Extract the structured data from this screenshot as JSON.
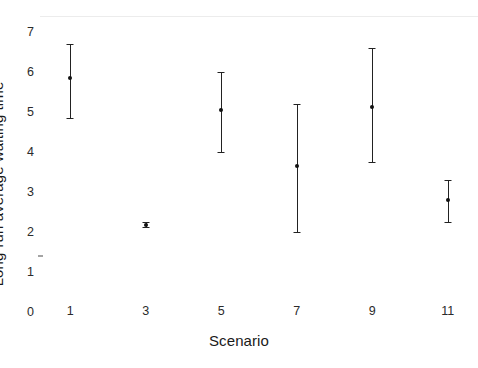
{
  "chart_data": {
    "type": "scatter",
    "title": "",
    "xlabel": "Scenario",
    "ylabel": "Long-run average waiting time",
    "xlim": [
      0.2,
      11.8
    ],
    "ylim": [
      0,
      7
    ],
    "grid": true,
    "legend": null,
    "xticks": [
      "1",
      "3",
      "5",
      "7",
      "9",
      "11"
    ],
    "xtick_values": [
      1,
      3,
      5,
      7,
      9,
      11
    ],
    "yticks": [
      "0",
      "1",
      "2",
      "3",
      "4",
      "5",
      "6",
      "7"
    ],
    "ytick_values": [
      0,
      1,
      2,
      3,
      4,
      5,
      6,
      7
    ],
    "categories": [
      1,
      3,
      5,
      7,
      9,
      11
    ],
    "values": [
      5.45,
      1.78,
      4.65,
      3.25,
      4.72,
      2.4
    ],
    "errors_low": [
      4.45,
      1.72,
      3.6,
      1.6,
      3.35,
      1.85
    ],
    "errors_high": [
      6.3,
      1.85,
      5.6,
      4.8,
      6.2,
      2.9
    ],
    "points": [
      {
        "x": 1,
        "y": 5.45,
        "low": 4.45,
        "high": 6.3
      },
      {
        "x": 3,
        "y": 1.78,
        "low": 1.72,
        "high": 1.85
      },
      {
        "x": 5,
        "y": 4.65,
        "low": 3.6,
        "high": 5.6
      },
      {
        "x": 7,
        "y": 3.25,
        "low": 1.6,
        "high": 4.8
      },
      {
        "x": 9,
        "y": 4.72,
        "low": 3.35,
        "high": 6.2
      },
      {
        "x": 11,
        "y": 2.4,
        "low": 1.85,
        "high": 2.9
      }
    ],
    "colors": {
      "marker": "#111111",
      "errorbar": "#222222",
      "gridline": "#ececec",
      "text": "#1a1a1a",
      "background": "#ffffff"
    }
  }
}
